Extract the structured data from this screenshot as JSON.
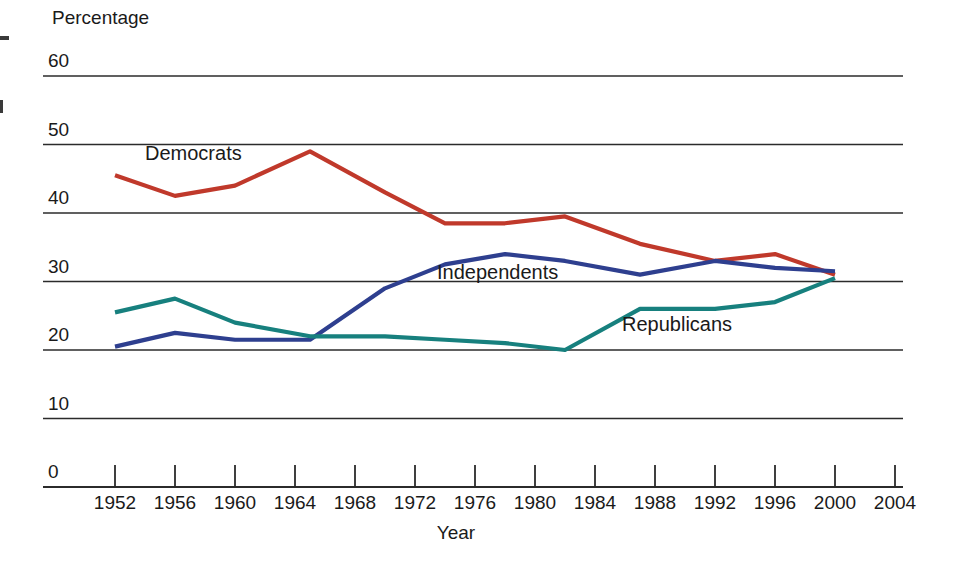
{
  "chart_data": {
    "type": "line",
    "title": "",
    "xlabel": "Year",
    "ylabel": "Percentage",
    "xlim": [
      1950,
      2004
    ],
    "ylim": [
      0,
      60
    ],
    "grid": true,
    "legend": "inline-labels",
    "x_ticks": [
      1952,
      1956,
      1960,
      1964,
      1968,
      1972,
      1976,
      1980,
      1984,
      1988,
      1992,
      1996,
      2000,
      2004
    ],
    "y_ticks": [
      0,
      10,
      20,
      30,
      40,
      50,
      60
    ],
    "series": [
      {
        "name": "Democrats",
        "color": "#c0392b",
        "x": [
          1952,
          1956,
          1960,
          1965,
          1970,
          1974,
          1978,
          1982,
          1987,
          1992,
          1996,
          2000
        ],
        "values": [
          45.5,
          42.5,
          44.0,
          49.0,
          43.0,
          38.5,
          38.5,
          39.5,
          35.5,
          33.0,
          34.0,
          31.0
        ]
      },
      {
        "name": "Independents",
        "color": "#2e3f8f",
        "x": [
          1952,
          1956,
          1960,
          1965,
          1970,
          1974,
          1978,
          1982,
          1987,
          1992,
          1996,
          2000
        ],
        "values": [
          20.5,
          22.5,
          21.5,
          21.5,
          29.0,
          32.5,
          34.0,
          33.0,
          31.0,
          33.0,
          32.0,
          31.5
        ]
      },
      {
        "name": "Republicans",
        "color": "#17807e",
        "x": [
          1952,
          1956,
          1960,
          1965,
          1970,
          1974,
          1978,
          1982,
          1987,
          1992,
          1996,
          2000
        ],
        "values": [
          25.5,
          27.5,
          24.0,
          22.0,
          22.0,
          21.5,
          21.0,
          20.0,
          26.0,
          26.0,
          27.0,
          30.5
        ]
      }
    ],
    "series_inline_labels": [
      {
        "name": "Democrats",
        "label": "Democrats",
        "x_px": 145,
        "y_px": 160
      },
      {
        "name": "Independents",
        "label": "Independents",
        "x_px": 437,
        "y_px": 279
      },
      {
        "name": "Republicans",
        "label": "Republicans",
        "x_px": 622,
        "y_px": 331
      }
    ]
  },
  "axes": {
    "y_axis_title": "Percentage",
    "x_axis_title": "Year"
  }
}
